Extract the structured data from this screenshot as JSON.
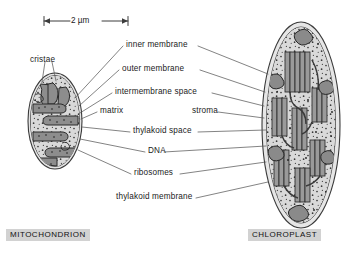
{
  "figure": {
    "background_color": "#ffffff",
    "line_color": "#4a4a4a",
    "text_color": "#1b1b1b",
    "tag_background_color": "#d2d2d2"
  },
  "scale_bar": {
    "label": "2 µm",
    "left_x": 44,
    "right_x": 128,
    "y": 21
  },
  "labels": [
    {
      "id": "cristae",
      "text": "cristae",
      "x": 30,
      "y": 56,
      "align": "left"
    },
    {
      "id": "inner-membrane",
      "text": "inner membrane",
      "x": 126,
      "y": 47,
      "align": "left"
    },
    {
      "id": "outer-membrane",
      "text": "outer membrane",
      "x": 122,
      "y": 71,
      "align": "left"
    },
    {
      "id": "intermembrane-space",
      "text": "intermembrane space",
      "x": 115,
      "y": 94,
      "align": "left"
    },
    {
      "id": "matrix",
      "text": "matrix",
      "x": 100,
      "y": 113,
      "align": "left"
    },
    {
      "id": "stroma",
      "text": "stroma",
      "x": 192,
      "y": 113,
      "align": "left"
    },
    {
      "id": "thylakoid-space",
      "text": "thylakoid space",
      "x": 133,
      "y": 133,
      "align": "left"
    },
    {
      "id": "dna",
      "text": "DNA",
      "x": 148,
      "y": 153,
      "align": "left"
    },
    {
      "id": "ribosomes",
      "text": "ribosomes",
      "x": 134,
      "y": 175,
      "align": "left"
    },
    {
      "id": "thylakoid-membrane",
      "text": "thylakoid membrane",
      "x": 116,
      "y": 199,
      "align": "left"
    }
  ],
  "organelles": [
    {
      "id": "mitochondrion",
      "tag": "MITOCHONDRION",
      "tag_x": 6,
      "tag_y": 229
    },
    {
      "id": "chloroplast",
      "tag": "CHLOROPLAST",
      "tag_x": 248,
      "tag_y": 229
    }
  ],
  "mitochondrion_shape": {
    "center_x": 55,
    "center_y": 121,
    "radius_x": 27,
    "radius_y": 48
  },
  "chloroplast_shape": {
    "center_x": 301,
    "center_y": 125,
    "radius_x": 39,
    "radius_y": 103
  }
}
